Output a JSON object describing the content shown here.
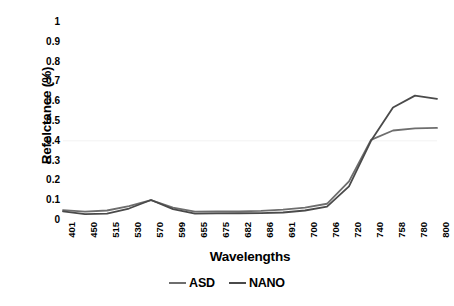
{
  "chart_data": {
    "type": "line",
    "title": "",
    "xlabel": "Wavelengths",
    "ylabel": "Refelctance (%)",
    "categories": [
      "401",
      "450",
      "515",
      "530",
      "570",
      "599",
      "655",
      "675",
      "682",
      "686",
      "691",
      "700",
      "706",
      "720",
      "740",
      "758",
      "780",
      "800"
    ],
    "x_tick_labels": [
      "401",
      "450",
      "515",
      "530",
      "570",
      "599",
      "655",
      "675",
      "682",
      "686",
      "691",
      "700",
      "706",
      "720",
      "740",
      "758",
      "780",
      "800"
    ],
    "y_tick_labels": [
      "1",
      "0.9",
      "0.8",
      "0.7",
      "0.6",
      "0.5",
      "0.4",
      "0.3",
      "0.2",
      "0.1",
      "0"
    ],
    "y_tick_values": [
      1,
      0.9,
      0.8,
      0.7,
      0.6,
      0.5,
      0.4,
      0.3,
      0.2,
      0.1,
      0
    ],
    "ylim": [
      0,
      1
    ],
    "grid": "horizontal-faint-0.4",
    "legend_position": "bottom-center",
    "series": [
      {
        "name": "ASD",
        "color": "#6e6e6e",
        "values": [
          0.05,
          0.042,
          0.048,
          0.07,
          0.1,
          0.062,
          0.042,
          0.043,
          0.044,
          0.046,
          0.052,
          0.062,
          0.082,
          0.195,
          0.405,
          0.452,
          0.463,
          0.465
        ]
      },
      {
        "name": "NANO",
        "color": "#4a4a4a",
        "values": [
          0.044,
          0.03,
          0.032,
          0.058,
          0.101,
          0.055,
          0.032,
          0.033,
          0.034,
          0.035,
          0.038,
          0.048,
          0.068,
          0.17,
          0.4,
          0.568,
          0.628,
          0.612
        ]
      }
    ]
  },
  "legend": {
    "entries": [
      {
        "label": "ASD",
        "color": "#6e6e6e"
      },
      {
        "label": "NANO",
        "color": "#4a4a4a"
      }
    ]
  }
}
